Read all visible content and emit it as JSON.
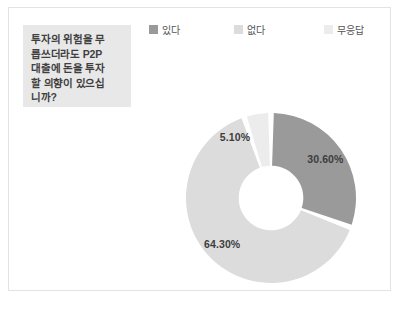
{
  "question": {
    "text": "투자의 위험을 무\n릅쓰더라도 P2P\n대출에 돈을 투자\n할 의향이 있으십\n니까?"
  },
  "legend": {
    "items": [
      {
        "label": "있다",
        "color": "#9a9a9a"
      },
      {
        "label": "없다",
        "color": "#dcdcdc"
      },
      {
        "label": "무응답",
        "color": "#ececec"
      }
    ]
  },
  "chart_data": {
    "type": "pie",
    "variant": "donut",
    "categories": [
      "있다",
      "없다",
      "무응답"
    ],
    "values": [
      30.6,
      64.3,
      5.1
    ],
    "labels": [
      "30.60%",
      "64.30%",
      "5.10%"
    ],
    "colors": [
      "#9a9a9a",
      "#dcdcdc",
      "#ececec"
    ],
    "unit": "%",
    "start_angle_deg": 0,
    "direction": "clockwise",
    "inner_radius_ratio": 0.38,
    "legend_position": "top",
    "grid": false
  }
}
